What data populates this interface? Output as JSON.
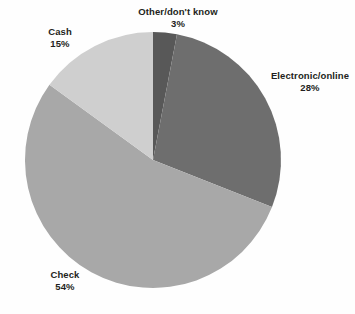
{
  "chart_data": {
    "type": "pie",
    "title": "",
    "subtitle": "",
    "xlabel": "",
    "ylabel": "",
    "grid": false,
    "legend_position": "none",
    "label_format": "name above percent",
    "start_angle_deg": 0,
    "direction": "clockwise",
    "categories": [
      "Other/don't know",
      "Electronic/online",
      "Check",
      "Cash"
    ],
    "values": [
      3,
      28,
      54,
      15
    ],
    "value_labels": [
      "3%",
      "28%",
      "54%",
      "15%"
    ],
    "units": "percent",
    "colors": [
      "#585858",
      "#6e6e6e",
      "#a8a8a8",
      "#cfcfcf"
    ],
    "background_color": "#fefefe",
    "label_color": "#231f20",
    "slices": [
      {
        "name": "Other/don't know",
        "value": 3,
        "value_label": "3%",
        "color": "#585858",
        "start_deg": 0,
        "end_deg": 10.8
      },
      {
        "name": "Electronic/online",
        "value": 28,
        "value_label": "28%",
        "color": "#6e6e6e",
        "start_deg": 10.8,
        "end_deg": 111.6
      },
      {
        "name": "Check",
        "value": 54,
        "value_label": "54%",
        "color": "#a8a8a8",
        "start_deg": 111.6,
        "end_deg": 306.0
      },
      {
        "name": "Cash",
        "value": 15,
        "value_label": "15%",
        "color": "#cfcfcf",
        "start_deg": 306.0,
        "end_deg": 360.0
      }
    ]
  },
  "labels": {
    "other": {
      "name": "Other/don't know",
      "value": "3%"
    },
    "electronic": {
      "name": "Electronic/online",
      "value": "28%"
    },
    "check": {
      "name": "Check",
      "value": "54%"
    },
    "cash": {
      "name": "Cash",
      "value": "15%"
    }
  }
}
